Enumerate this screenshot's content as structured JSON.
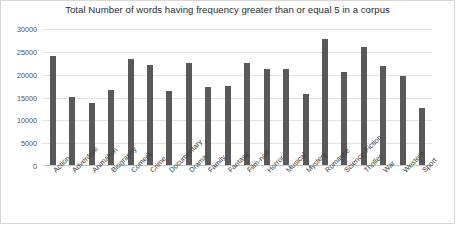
{
  "chart_data": {
    "type": "bar",
    "title": "Total Number of words having frequency greater than or equal 5 in a corpus",
    "xlabel": "",
    "ylabel": "",
    "ylim": [
      0,
      30000
    ],
    "ytick_step": 5000,
    "yticks": [
      "0",
      "5000",
      "10000",
      "15000",
      "20000",
      "25000",
      "30000"
    ],
    "grid": true,
    "legend": false,
    "bar_color": "#595959",
    "categories": [
      "Action",
      "Adventure",
      "Animation",
      "Biography",
      "Comedy",
      "Crime",
      "Documentary",
      "Drama",
      "Family",
      "Fantasy",
      "Film-noir",
      "Horror",
      "Musical",
      "Mystery",
      "Romance",
      "Science-Fiction",
      "Thriller",
      "War",
      "Western",
      "Sport"
    ],
    "values": [
      23800,
      15000,
      13500,
      16500,
      23300,
      21800,
      16300,
      22300,
      17000,
      17300,
      22400,
      21000,
      21000,
      15600,
      27600,
      20300,
      25800,
      21600,
      19600,
      12400
    ]
  }
}
